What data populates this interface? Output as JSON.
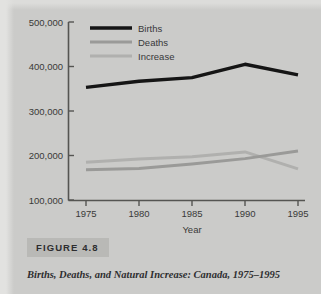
{
  "figure": {
    "tag": "FIGURE 4.8",
    "caption": "Births, Deaths, and Natural Increase: Canada, 1975–1995"
  },
  "colors": {
    "background": "#cbcbc9",
    "axis": "#555552",
    "births": "#151515",
    "deaths": "#9a9a98",
    "increase": "#b0b0ae",
    "figure_tag_background": "#b9b9b6"
  },
  "chart_data": {
    "type": "line",
    "title": "",
    "xlabel": "Year",
    "ylabel": "",
    "x": [
      1975,
      1980,
      1985,
      1990,
      1995
    ],
    "xticklabels": [
      "1975",
      "1980",
      "1985",
      "1990",
      "1995"
    ],
    "yticks": [
      100000,
      200000,
      300000,
      400000,
      500000
    ],
    "yticklabels": [
      "100,000",
      "200,000",
      "300,000",
      "400,000",
      "500,000"
    ],
    "ylim": [
      100000,
      500000
    ],
    "xlim": [
      1975,
      1995
    ],
    "grid": false,
    "legend_position": "top-center",
    "series": [
      {
        "name": "Births",
        "color": "#151515",
        "width": 3.4,
        "values": [
          353000,
          367000,
          375000,
          405000,
          381000
        ]
      },
      {
        "name": "Deaths",
        "color": "#9a9a98",
        "width": 3.0,
        "values": [
          168000,
          171000,
          181000,
          193000,
          210000
        ]
      },
      {
        "name": "Increase",
        "color": "#b0b0ae",
        "width": 3.0,
        "values": [
          185000,
          192000,
          197000,
          208000,
          170000
        ]
      }
    ]
  }
}
